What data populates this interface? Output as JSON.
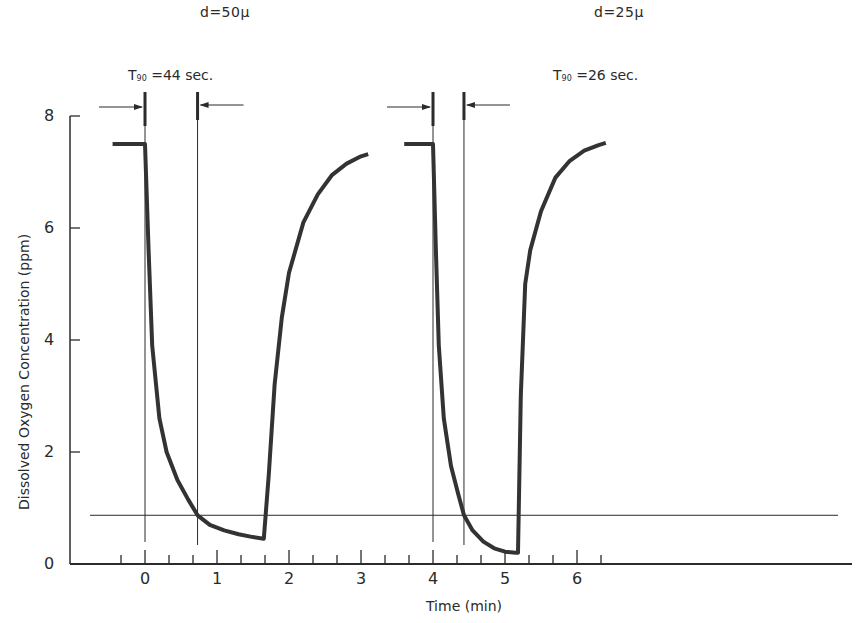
{
  "chart_data": {
    "type": "line",
    "title": "",
    "xlabel": "Time (min)",
    "ylabel": "Dissolved Oxygen Concentration (ppm)",
    "xlim": [
      -0.65,
      6.4
    ],
    "ylim": [
      0,
      8
    ],
    "x_ticks": [
      0,
      1,
      2,
      3,
      4,
      5,
      6
    ],
    "x_tick_labels": [
      "0",
      "1",
      "2",
      "3",
      "4",
      "5",
      "6"
    ],
    "y_ticks": [
      0,
      2,
      4,
      6,
      8
    ],
    "y_tick_labels": [
      "0",
      "2",
      "4",
      "6",
      "8"
    ],
    "grid": false,
    "reference_line_y": 0.87,
    "series": [
      {
        "name": "d=50μ",
        "condition_label": "d=50μ",
        "t90_label": "T90 = 44 sec.",
        "t90_prefix": "T",
        "t90_sub": "90",
        "t90_value": "=44 sec.",
        "step_time_min": 0.0,
        "t90_time_min": 0.73,
        "x": [
          -0.45,
          0.0,
          0.05,
          0.1,
          0.2,
          0.3,
          0.45,
          0.6,
          0.73,
          0.9,
          1.1,
          1.3,
          1.5,
          1.65,
          1.72,
          1.8,
          1.9,
          2.0,
          2.2,
          2.4,
          2.6,
          2.8,
          3.0,
          3.1
        ],
        "y": [
          7.5,
          7.5,
          5.6,
          3.9,
          2.6,
          2.0,
          1.5,
          1.15,
          0.87,
          0.7,
          0.6,
          0.53,
          0.48,
          0.45,
          1.6,
          3.2,
          4.4,
          5.2,
          6.1,
          6.6,
          6.95,
          7.15,
          7.28,
          7.32
        ]
      },
      {
        "name": "d=25μ",
        "condition_label": "d=25μ",
        "t90_label": "T90 = 26 sec.",
        "t90_prefix": "T",
        "t90_sub": "90",
        "t90_value": "=26 sec.",
        "step_time_min": 4.0,
        "t90_time_min": 4.43,
        "x": [
          3.6,
          4.0,
          4.04,
          4.08,
          4.15,
          4.25,
          4.35,
          4.43,
          4.55,
          4.7,
          4.85,
          5.0,
          5.15,
          5.18,
          5.22,
          5.28,
          5.35,
          5.5,
          5.7,
          5.9,
          6.1,
          6.3,
          6.4
        ],
        "y": [
          7.5,
          7.5,
          5.6,
          3.9,
          2.6,
          1.75,
          1.25,
          0.87,
          0.6,
          0.4,
          0.28,
          0.22,
          0.2,
          0.2,
          3.0,
          5.0,
          5.6,
          6.3,
          6.9,
          7.2,
          7.38,
          7.48,
          7.52
        ]
      }
    ]
  }
}
